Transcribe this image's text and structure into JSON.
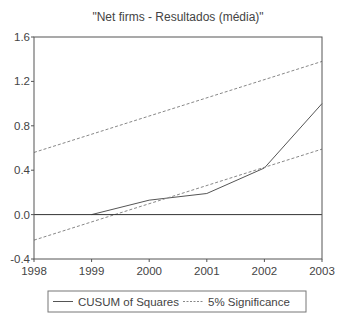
{
  "chart_data": {
    "type": "line",
    "title": "\"Net firms - Resultados (média)\"",
    "xlabel": "",
    "ylabel": "",
    "x_ticks": [
      "1998",
      "1999",
      "2000",
      "2001",
      "2002",
      "2003"
    ],
    "y_ticks": [
      "-0.4",
      "0.0",
      "0.4",
      "0.8",
      "1.2",
      "1.6"
    ],
    "xlim": [
      1998,
      2003
    ],
    "ylim": [
      -0.4,
      1.6
    ],
    "grid": false,
    "legend_position": "bottom",
    "series": [
      {
        "name": "CUSUM of Squares",
        "style": "solid",
        "color": "#555555",
        "x": [
          1999,
          2000,
          2001,
          2002,
          2003
        ],
        "values": [
          0.0,
          0.13,
          0.19,
          0.42,
          1.0
        ]
      },
      {
        "name": "5% Significance",
        "style": "dashed",
        "color": "#888888",
        "x": [
          1998,
          2003
        ],
        "values": [
          0.56,
          1.38
        ]
      },
      {
        "name": "5% Significance (lower)",
        "style": "dashed",
        "color": "#888888",
        "x": [
          1998,
          2003
        ],
        "values": [
          -0.23,
          0.59
        ]
      }
    ],
    "reference_lines": [
      {
        "y": 0.0,
        "color": "#333333"
      }
    ]
  },
  "legend": {
    "items": [
      {
        "label": "CUSUM of Squares",
        "style": "solid"
      },
      {
        "label": "5% Significance",
        "style": "dashed"
      }
    ]
  }
}
